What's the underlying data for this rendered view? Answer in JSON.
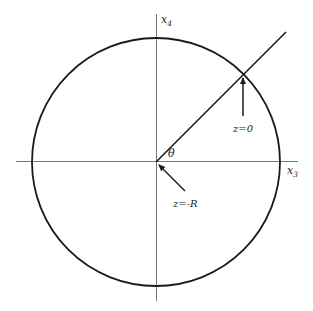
{
  "diagram": {
    "type": "geometry",
    "axes": {
      "horizontal_label": "x",
      "horizontal_sub": "3",
      "vertical_label": "x",
      "vertical_sub": "4"
    },
    "angle_label": "θ",
    "annotations": {
      "top": "z=0",
      "center": "z=-R"
    },
    "colors": {
      "stroke": "#1a1a1a",
      "axis": "#555555",
      "background": "#ffffff"
    }
  }
}
